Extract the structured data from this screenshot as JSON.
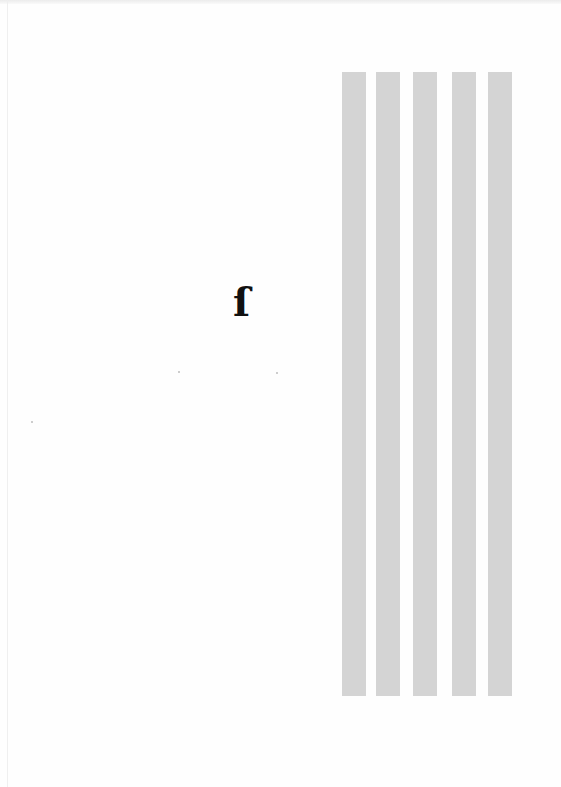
{
  "page": {
    "background": "#fefefe",
    "glyph": {
      "text": "ɩ̂",
      "display": "ſ"
    },
    "stripes": [
      {
        "left": 342,
        "color": "#d4d4d4"
      },
      {
        "left": 376,
        "color": "#d4d4d4"
      },
      {
        "left": 413,
        "color": "#d4d4d4"
      },
      {
        "left": 452,
        "color": "#d4d4d4"
      },
      {
        "left": 488,
        "color": "#d4d4d4"
      }
    ]
  }
}
